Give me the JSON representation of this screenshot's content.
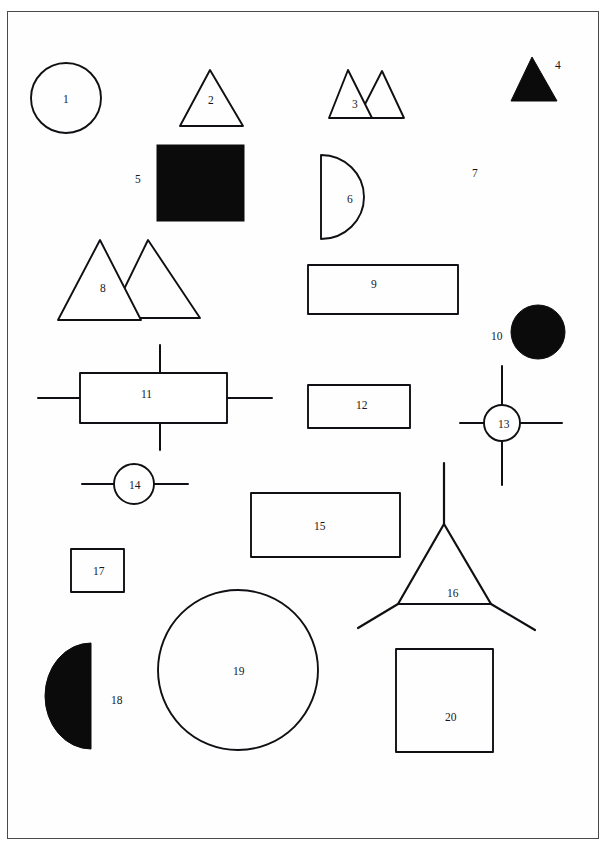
{
  "figure": {
    "frame": {
      "x": 7,
      "y": 11,
      "width": 592,
      "height": 828,
      "stroke": "#4a4a4a",
      "stroke_width": 1.4
    },
    "canvas": {
      "width": 606,
      "height": 844,
      "background": "#ffffff"
    },
    "ink_color": "#101014",
    "fill_black": "#0b0b0b",
    "shapes": [
      {
        "id": 1,
        "label": "1",
        "kind": "circle-outline",
        "label_x": 63,
        "label_y": 94,
        "geometry": {
          "cx": 66,
          "cy": 98,
          "r": 35
        }
      },
      {
        "id": 2,
        "label": "2",
        "kind": "triangle-outline",
        "label_x": 208,
        "label_y": 95,
        "geometry": {
          "points": "210,70 243,126 180,126"
        }
      },
      {
        "id": 3,
        "label": "3",
        "kind": "double-triangle-outline",
        "label_x": 352,
        "label_y": 99,
        "geometry": {
          "points_a": "348,70 372,118 329,118",
          "points_b": "382,71 404,118 358,118"
        }
      },
      {
        "id": 4,
        "label": "4",
        "kind": "triangle-filled",
        "label_x": 555,
        "label_y": 60,
        "geometry": {
          "points": "532,57 557,101 511,101"
        }
      },
      {
        "id": 5,
        "label": "5",
        "kind": "square-filled",
        "label_x": 135,
        "label_y": 174,
        "geometry": {
          "x": 157,
          "y": 145,
          "width": 87,
          "height": 76
        }
      },
      {
        "id": 6,
        "label": "6",
        "kind": "half-disc-outline",
        "label_x": 347,
        "label_y": 194,
        "geometry": {
          "flat_x": 321,
          "top_y": 155,
          "bottom_y": 239,
          "bulge_x": 364
        }
      },
      {
        "id": 7,
        "label": "7",
        "kind": "two-circles-outline",
        "label_x": 472,
        "label_y": 168,
        "geometry": {
          "big": {
            "cx": 462,
            "cy": 181,
            "r": 27
          },
          "small": {
            "cx": 427,
            "cy": 211,
            "r": 17
          }
        }
      },
      {
        "id": 8,
        "label": "8",
        "kind": "double-triangle-outline",
        "label_x": 100,
        "label_y": 283,
        "geometry": {
          "points_a": "100,240 141,320 58,320",
          "points_b": "148,240 200,318 110,318"
        }
      },
      {
        "id": 9,
        "label": "9",
        "kind": "rectangle-outline",
        "label_x": 371,
        "label_y": 279,
        "geometry": {
          "x": 308,
          "y": 265,
          "width": 150,
          "height": 49
        }
      },
      {
        "id": 10,
        "label": "10",
        "kind": "circle-filled",
        "label_x": 491,
        "label_y": 331,
        "geometry": {
          "cx": 538,
          "cy": 332,
          "r": 27
        }
      },
      {
        "id": 11,
        "label": "11",
        "kind": "rectangle-outline-with-leads",
        "label_x": 141,
        "label_y": 389,
        "geometry": {
          "x": 80,
          "y": 373,
          "width": 147,
          "height": 50,
          "lead_left": {
            "x1": 38,
            "y1": 398,
            "x2": 80,
            "y2": 398
          },
          "lead_right": {
            "x1": 227,
            "y1": 398,
            "x2": 272,
            "y2": 398
          },
          "lead_top": {
            "x1": 160,
            "y1": 345,
            "x2": 160,
            "y2": 373
          },
          "lead_bottom": {
            "x1": 160,
            "y1": 423,
            "x2": 160,
            "y2": 450
          }
        }
      },
      {
        "id": 12,
        "label": "12",
        "kind": "rectangle-outline",
        "label_x": 356,
        "label_y": 400,
        "geometry": {
          "x": 308,
          "y": 385,
          "width": 102,
          "height": 43
        }
      },
      {
        "id": 13,
        "label": "13",
        "kind": "circle-outline-with-leads",
        "label_x": 498,
        "label_y": 419,
        "geometry": {
          "cx": 502,
          "cy": 423,
          "r": 18,
          "lead_left": {
            "x1": 460,
            "y1": 423,
            "x2": 484,
            "y2": 423
          },
          "lead_right": {
            "x1": 520,
            "y1": 423,
            "x2": 562,
            "y2": 423
          },
          "lead_top": {
            "x1": 502,
            "y1": 366,
            "x2": 502,
            "y2": 405
          },
          "lead_bottom": {
            "x1": 502,
            "y1": 441,
            "x2": 502,
            "y2": 485
          }
        }
      },
      {
        "id": 14,
        "label": "14",
        "kind": "circle-outline-with-leads",
        "label_x": 129,
        "label_y": 480,
        "geometry": {
          "cx": 134,
          "cy": 484,
          "r": 20,
          "lead_left": {
            "x1": 82,
            "y1": 484,
            "x2": 114,
            "y2": 484
          },
          "lead_right": {
            "x1": 154,
            "y1": 484,
            "x2": 188,
            "y2": 484
          }
        }
      },
      {
        "id": 15,
        "label": "15",
        "kind": "rectangle-outline",
        "label_x": 314,
        "label_y": 521,
        "geometry": {
          "x": 251,
          "y": 493,
          "width": 149,
          "height": 64
        }
      },
      {
        "id": 16,
        "label": "16",
        "kind": "triangle-outline-with-legs",
        "label_x": 447,
        "label_y": 588,
        "geometry": {
          "points": "444,524 491,604 398,604",
          "leg_top": {
            "x1": 444,
            "y1": 463,
            "x2": 444,
            "y2": 524
          },
          "leg_left": {
            "x1": 398,
            "y1": 604,
            "x2": 358,
            "y2": 628
          },
          "leg_right": {
            "x1": 491,
            "y1": 604,
            "x2": 535,
            "y2": 630
          }
        }
      },
      {
        "id": 17,
        "label": "17",
        "kind": "rectangle-outline",
        "label_x": 93,
        "label_y": 566,
        "geometry": {
          "x": 71,
          "y": 549,
          "width": 53,
          "height": 43
        }
      },
      {
        "id": 18,
        "label": "18",
        "kind": "half-disc-filled",
        "label_x": 111,
        "label_y": 695,
        "geometry": {
          "flat_x": 91,
          "top_y": 643,
          "bottom_y": 749,
          "bulge_x": 45
        }
      },
      {
        "id": 19,
        "label": "19",
        "kind": "circle-outline",
        "label_x": 233,
        "label_y": 666,
        "geometry": {
          "cx": 238,
          "cy": 670,
          "r": 80
        }
      },
      {
        "id": 20,
        "label": "20",
        "kind": "square-outline",
        "label_x": 445,
        "label_y": 712,
        "geometry": {
          "x": 396,
          "y": 649,
          "width": 97,
          "height": 103
        }
      }
    ]
  }
}
